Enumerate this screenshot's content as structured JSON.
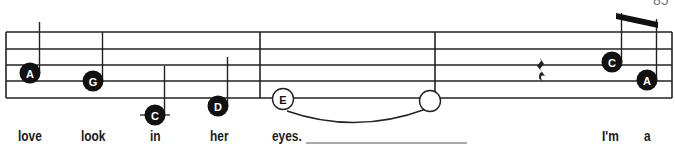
{
  "page": {
    "number": "85"
  },
  "staff": {
    "lines_y": [
      32,
      49,
      65,
      81,
      98
    ],
    "x_start": 6,
    "x_end": 672,
    "barlines_x": [
      6,
      260,
      435,
      672
    ],
    "line_color": "#222222"
  },
  "notes": [
    {
      "id": "n1",
      "name": "A",
      "x": 30,
      "y": 73,
      "filled": true,
      "stem": "up",
      "stem_top": 22,
      "ledger": false
    },
    {
      "id": "n2",
      "name": "G",
      "x": 93,
      "y": 81,
      "filled": true,
      "stem": "up",
      "stem_top": 32,
      "ledger": false
    },
    {
      "id": "n3",
      "name": "C",
      "x": 155,
      "y": 115,
      "filled": true,
      "stem": "up",
      "stem_top": 66,
      "ledger": true
    },
    {
      "id": "n4",
      "name": "D",
      "x": 218,
      "y": 106,
      "filled": true,
      "stem": "up",
      "stem_top": 57,
      "ledger": false
    },
    {
      "id": "n5",
      "name": "E",
      "x": 283,
      "y": 99,
      "filled": false,
      "stem": "none",
      "ledger": false
    },
    {
      "id": "n6",
      "name": "",
      "x": 430,
      "y": 101,
      "filled": false,
      "stem": "none",
      "ledger": false
    },
    {
      "id": "n7",
      "name": "C",
      "x": 612,
      "y": 62,
      "filled": true,
      "stem": "up",
      "stem_top": 13,
      "ledger": false
    },
    {
      "id": "n8",
      "name": "A",
      "x": 647,
      "y": 80,
      "filled": true,
      "stem": "up",
      "stem_top": 19,
      "ledger": false
    }
  ],
  "tie": {
    "from_note": "E",
    "x1": 287,
    "x2": 426,
    "y": 111
  },
  "rest": {
    "type": "quarter-rest",
    "x": 540,
    "y": 58
  },
  "beam": {
    "x1": 616,
    "y1": 13,
    "x2": 658,
    "y2": 22
  },
  "lyrics": [
    {
      "text": "love",
      "x": 18
    },
    {
      "text": "look",
      "x": 81
    },
    {
      "text": "in",
      "x": 150
    },
    {
      "text": "her",
      "x": 210
    },
    {
      "text": "eyes.",
      "x": 272
    },
    {
      "text": "I'm",
      "x": 602
    },
    {
      "text": "a",
      "x": 644
    }
  ],
  "extender_line": {
    "x1": 306,
    "x2": 467,
    "y": 143
  }
}
